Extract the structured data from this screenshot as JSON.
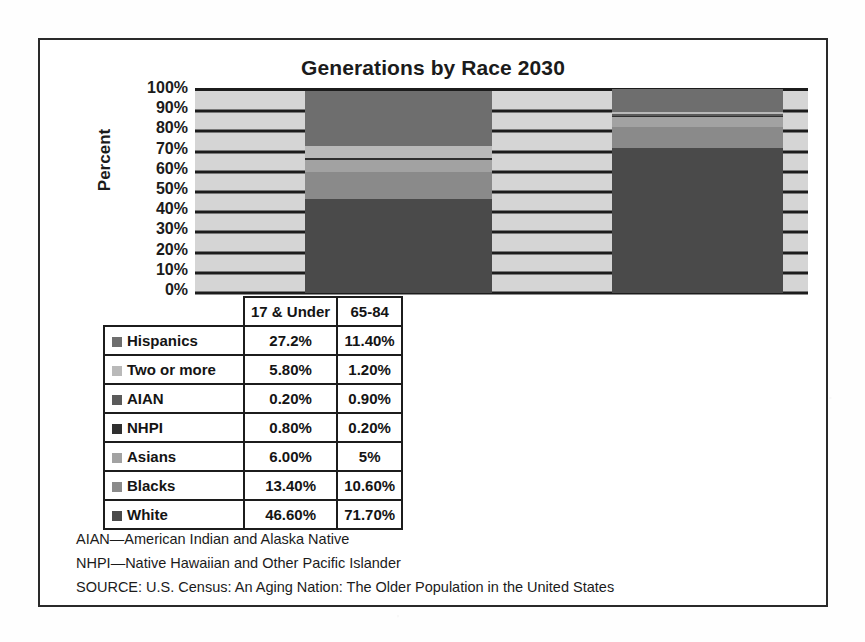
{
  "chart_data": {
    "type": "bar",
    "subtype": "stacked-percent",
    "title": "Generations by Race 2030",
    "xlabel": "",
    "ylabel": "Percent",
    "ylim": [
      0,
      100
    ],
    "ytick_labels": [
      "100%",
      "90%",
      "80%",
      "70%",
      "60%",
      "50%",
      "40%",
      "30%",
      "20%",
      "10%",
      "0%"
    ],
    "yticks": [
      100,
      90,
      80,
      70,
      60,
      50,
      40,
      30,
      20,
      10,
      0
    ],
    "grid": true,
    "legend_position": "table-row-labels",
    "categories": [
      "17 & Under",
      "65-84"
    ],
    "series": [
      {
        "name": "Hispanics",
        "values": [
          27.2,
          11.4
        ],
        "labels": [
          "27.2%",
          "11.40%"
        ],
        "color": "#6e6e6e"
      },
      {
        "name": "Two or more",
        "values": [
          5.8,
          1.2
        ],
        "labels": [
          "5.80%",
          "1.20%"
        ],
        "color": "#b9b9b9"
      },
      {
        "name": "AIAN",
        "values": [
          0.2,
          0.9
        ],
        "labels": [
          "0.20%",
          "0.90%"
        ],
        "color": "#5a5a5a"
      },
      {
        "name": "NHPI",
        "values": [
          0.8,
          0.2
        ],
        "labels": [
          "0.80%",
          "0.20%"
        ],
        "color": "#2f2f2f"
      },
      {
        "name": "Asians",
        "values": [
          6.0,
          5.0
        ],
        "labels": [
          "6.00%",
          "5%"
        ],
        "color": "#a2a2a2"
      },
      {
        "name": "Blacks",
        "values": [
          13.4,
          10.6
        ],
        "labels": [
          "13.40%",
          "10.60%"
        ],
        "color": "#8a8a8a"
      },
      {
        "name": "White",
        "values": [
          46.6,
          71.7
        ],
        "labels": [
          "46.60%",
          "71.70%"
        ],
        "color": "#4a4a4a"
      }
    ],
    "plot_background": "#d5d5d5",
    "gridline_color": "#1c1c1c"
  },
  "table": {
    "header": {
      "corner": "",
      "columns": [
        "17 & Under",
        "65-84"
      ]
    },
    "rows": [
      {
        "label": "Hispanics",
        "swatch": "#6e6e6e",
        "values": [
          "27.2%",
          "11.40%"
        ]
      },
      {
        "label": "Two or more",
        "swatch": "#b9b9b9",
        "values": [
          "5.80%",
          "1.20%"
        ]
      },
      {
        "label": "AIAN",
        "swatch": "#5a5a5a",
        "values": [
          "0.20%",
          "0.90%"
        ]
      },
      {
        "label": "NHPI",
        "swatch": "#2f2f2f",
        "values": [
          "0.80%",
          "0.20%"
        ]
      },
      {
        "label": "Asians",
        "swatch": "#a2a2a2",
        "values": [
          "6.00%",
          "5%"
        ]
      },
      {
        "label": "Blacks",
        "swatch": "#8a8a8a",
        "values": [
          "13.40%",
          "10.60%"
        ]
      },
      {
        "label": "White",
        "swatch": "#4a4a4a",
        "values": [
          "46.60%",
          "71.70%"
        ]
      }
    ]
  },
  "footnotes": [
    "AIAN—American Indian and Alaska Native",
    "NHPI—Native Hawaiian and Other Pacific Islander",
    "SOURCE: U.S. Census: An Aging Nation: The Older Population in the United States"
  ]
}
